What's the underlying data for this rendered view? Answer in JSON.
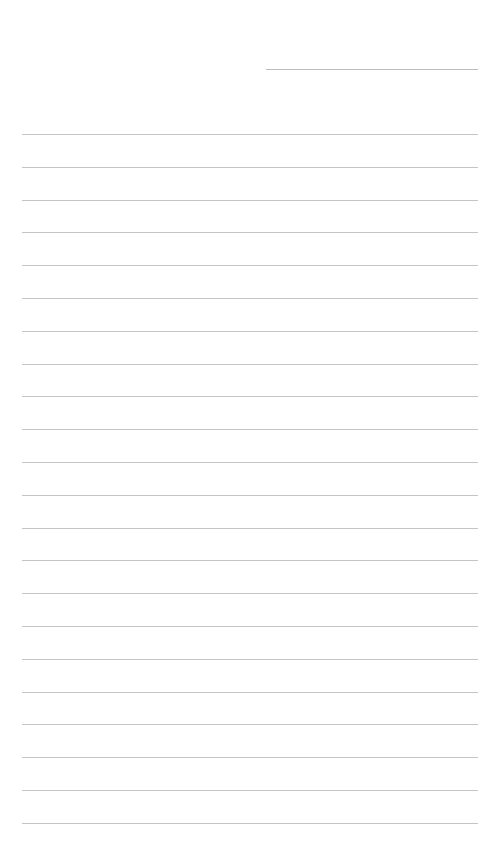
{
  "page": {
    "type": "lined-paper",
    "background": "#ffffff",
    "line_color": "#c4c4c4",
    "header_line": {
      "x": 266,
      "y": 69,
      "width": 212
    },
    "ruled_lines": {
      "count": 22,
      "first_y": 134,
      "spacing": 32.8,
      "x": 22,
      "width": 456
    }
  }
}
